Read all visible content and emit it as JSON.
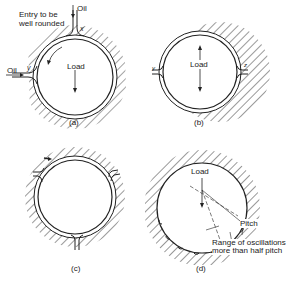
{
  "figures": [
    {
      "id": "a",
      "caption": "(a)",
      "labels": {
        "entry": "Entry to be well rounded",
        "entry_line1": "Entry to be",
        "entry_line2": "well rounded",
        "oil_top": "Oil",
        "oil_left": "Oil",
        "x": "x",
        "y": "y",
        "load": "Load"
      }
    },
    {
      "id": "b",
      "caption": "(b)",
      "labels": {
        "load": "Load",
        "y": "y",
        "z": "z"
      }
    },
    {
      "id": "c",
      "caption": "(c)",
      "labels": {}
    },
    {
      "id": "d",
      "caption": "(d)",
      "labels": {
        "load": "Load",
        "pitch": "Pitch",
        "range_line1": "Range of oscillations",
        "range_line2": "more than half pitch"
      }
    }
  ],
  "colors": {
    "line": "#222222",
    "background": "#ffffff"
  }
}
